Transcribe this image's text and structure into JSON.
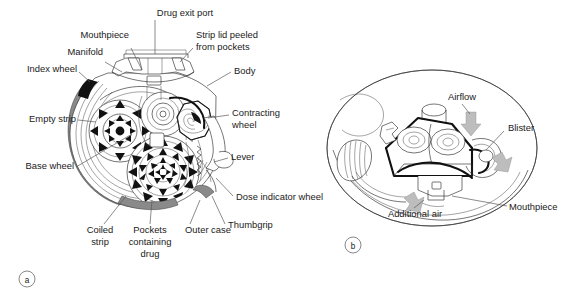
{
  "figure": {
    "caption_a": "a",
    "caption_b": "b",
    "panel_a": {
      "name": "inhaler-internal-mechanism",
      "labels": [
        {
          "key": "drug_exit_port",
          "text": "Drug exit port"
        },
        {
          "key": "mouthpiece",
          "text": "Mouthpiece"
        },
        {
          "key": "strip_lid_line1",
          "text": "Strip lid peeled"
        },
        {
          "key": "strip_lid_line2",
          "text": "from pockets"
        },
        {
          "key": "manifold",
          "text": "Manifold"
        },
        {
          "key": "index_wheel",
          "text": "Index wheel"
        },
        {
          "key": "body",
          "text": "Body"
        },
        {
          "key": "empty_strip",
          "text": "Empty strip"
        },
        {
          "key": "contracting_line1",
          "text": "Contracting"
        },
        {
          "key": "contracting_line2",
          "text": "wheel"
        },
        {
          "key": "base_wheel",
          "text": "Base wheel"
        },
        {
          "key": "lever",
          "text": "Lever"
        },
        {
          "key": "dose_indicator_wheel",
          "text": "Dose indicator wheel"
        },
        {
          "key": "thumbgrip",
          "text": "Thumbgrip"
        },
        {
          "key": "coiled_line1",
          "text": "Coiled"
        },
        {
          "key": "coiled_line2",
          "text": "strip"
        },
        {
          "key": "pockets_line1",
          "text": "Pockets"
        },
        {
          "key": "pockets_line2",
          "text": "containing"
        },
        {
          "key": "pockets_line3",
          "text": "drug"
        },
        {
          "key": "outer_case",
          "text": "Outer case"
        }
      ]
    },
    "panel_b": {
      "name": "inhaler-airflow-cutaway",
      "labels": [
        {
          "key": "airflow",
          "text": "Airflow"
        },
        {
          "key": "blister",
          "text": "Blister"
        },
        {
          "key": "mouthpiece",
          "text": "Mouthpiece"
        },
        {
          "key": "additional_air",
          "text": "Additional air"
        }
      ]
    },
    "colors": {
      "background": "#ffffff",
      "line": "#2b2b2b",
      "bold_line": "#111111",
      "text": "#1a1a1a",
      "leader": "#5a5a5a",
      "shadow_gray": "#8a8a8a",
      "light_gray": "#c9c9c9",
      "arrow_gray": "#bdbdbd"
    }
  }
}
